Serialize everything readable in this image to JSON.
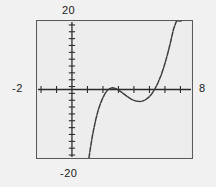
{
  "figure": {
    "kind": "graphing-calculator-plot",
    "background_color": "#f1f1f1",
    "plot_background_color": "#ededed",
    "frame_color": "#5a5a5a",
    "curve_color": "#3c3c3c",
    "axis_color": "#2b2b2b"
  },
  "labels": {
    "y_max": "20",
    "y_min": "-20",
    "x_min": "-2",
    "x_max": "8"
  },
  "chart_data": {
    "type": "line",
    "title": "",
    "xlabel": "",
    "ylabel": "",
    "xlim": [
      -2,
      8
    ],
    "ylim": [
      -20,
      20
    ],
    "xtick_labels": [
      "-2",
      "8"
    ],
    "ytick_labels": [
      "-20",
      "20"
    ],
    "xticks": [
      -2,
      -1,
      0,
      1,
      2,
      3,
      4,
      5,
      6,
      7,
      8
    ],
    "yticks": [
      -20,
      -18,
      -16,
      -14,
      -12,
      -10,
      -8,
      -6,
      -4,
      -2,
      0,
      2,
      4,
      6,
      8,
      10,
      12,
      14,
      16,
      18,
      20
    ],
    "tick_step_x": 1,
    "tick_step_y": 2,
    "grid": false,
    "legend": false,
    "axes_drawn": [
      "x-axis at y=0",
      "y-axis at x=0"
    ],
    "series": [
      {
        "name": "curve",
        "x": [
          1.35,
          1.45,
          1.55,
          1.65,
          1.8,
          1.95,
          2.1,
          2.25,
          2.4,
          2.55,
          2.7,
          2.85,
          3.0,
          3.2,
          3.4,
          3.6,
          3.8,
          4.0,
          4.2,
          4.4,
          4.6,
          4.8,
          5.0,
          5.2,
          5.4,
          5.6,
          5.8,
          6.0,
          6.2,
          6.4,
          6.6,
          6.8,
          7.0,
          7.1,
          7.2,
          7.3
        ],
        "y": [
          -20.0,
          -17.0,
          -14.2,
          -11.8,
          -8.6,
          -6.0,
          -4.0,
          -2.4,
          -1.1,
          -0.2,
          0.3,
          0.5,
          0.4,
          0.0,
          -0.6,
          -1.3,
          -2.0,
          -2.6,
          -3.1,
          -3.4,
          -3.5,
          -3.4,
          -3.0,
          -2.3,
          -1.3,
          0.1,
          1.9,
          4.1,
          6.8,
          9.9,
          13.5,
          17.5,
          20.0,
          20.0,
          20.0,
          20.0
        ]
      }
    ]
  }
}
